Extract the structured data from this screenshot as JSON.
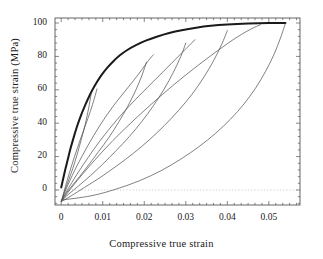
{
  "chart_data": {
    "type": "line",
    "title": "",
    "xlabel": "Compressive true strain",
    "ylabel": "Compressive true strain (MPa)",
    "xlim": [
      -0.0015,
      0.0575
    ],
    "ylim": [
      -9,
      103
    ],
    "xticks": [
      0,
      0.01,
      0.02,
      0.03,
      0.04,
      0.05
    ],
    "xtick_labels": [
      "0",
      "0.01",
      "0.02",
      "0.03",
      "0.04",
      "0.05"
    ],
    "yticks": [
      0,
      20,
      40,
      60,
      80,
      100
    ],
    "ytick_labels": [
      "0",
      "20",
      "40",
      "60",
      "80",
      "100"
    ],
    "x_minor_ticks": 5,
    "y_minor_ticks": 4,
    "grid": false,
    "legend": null,
    "zero_line": {
      "y": 0,
      "style": "dotted",
      "color": "#b9b9b9"
    },
    "frame": {
      "color": "#555555"
    },
    "series": [
      {
        "name": "Loading envelope",
        "role": "monotonic-envelope",
        "color": "#1a1a1a",
        "width": 2.0,
        "points": [
          [
            0.0,
            1.5
          ],
          [
            0.0004,
            6.0
          ],
          [
            0.001,
            12.5
          ],
          [
            0.0016,
            18.5
          ],
          [
            0.0022,
            24.5
          ],
          [
            0.003,
            31.5
          ],
          [
            0.0038,
            38.0
          ],
          [
            0.0048,
            45.0
          ],
          [
            0.0058,
            51.0
          ],
          [
            0.007,
            57.5
          ],
          [
            0.0082,
            63.0
          ],
          [
            0.0096,
            68.5
          ],
          [
            0.011,
            73.0
          ],
          [
            0.0125,
            77.0
          ],
          [
            0.0142,
            80.8
          ],
          [
            0.016,
            84.0
          ],
          [
            0.018,
            86.8
          ],
          [
            0.0205,
            89.6
          ],
          [
            0.023,
            91.8
          ],
          [
            0.026,
            94.0
          ],
          [
            0.029,
            95.7
          ],
          [
            0.0325,
            97.2
          ],
          [
            0.036,
            98.3
          ],
          [
            0.04,
            99.1
          ],
          [
            0.045,
            99.7
          ],
          [
            0.05,
            100.0
          ],
          [
            0.054,
            100.0
          ]
        ]
      },
      {
        "name": "Unload 1",
        "role": "unloading",
        "color": "#4a4a4a",
        "width": 0.7,
        "peak": [
          0.0072,
          57.5
        ],
        "end": [
          0.0002,
          -5.5
        ],
        "points": [
          [
            0.0072,
            57.5
          ],
          [
            0.0066,
            49.0
          ],
          [
            0.0058,
            39.5
          ],
          [
            0.0048,
            30.0
          ],
          [
            0.0038,
            21.0
          ],
          [
            0.0028,
            13.0
          ],
          [
            0.0018,
            6.0
          ],
          [
            0.001,
            0.5
          ],
          [
            0.0005,
            -3.0
          ],
          [
            0.0002,
            -5.5
          ]
        ]
      },
      {
        "name": "Reload 1",
        "role": "reloading",
        "color": "#4a4a4a",
        "width": 0.7,
        "points": [
          [
            0.0002,
            -5.5
          ],
          [
            0.001,
            2.0
          ],
          [
            0.002,
            10.5
          ],
          [
            0.0032,
            20.0
          ],
          [
            0.0045,
            29.5
          ],
          [
            0.0058,
            38.5
          ],
          [
            0.007,
            47.0
          ],
          [
            0.008,
            55.0
          ],
          [
            0.0086,
            60.5
          ]
        ]
      },
      {
        "name": "Unload 2",
        "role": "unloading",
        "color": "#4a4a4a",
        "width": 0.7,
        "peak": [
          0.0205,
          76.5
        ],
        "end": [
          0.0001,
          -6.2
        ],
        "points": [
          [
            0.0205,
            76.5
          ],
          [
            0.0195,
            69.0
          ],
          [
            0.018,
            60.0
          ],
          [
            0.016,
            50.0
          ],
          [
            0.0138,
            40.5
          ],
          [
            0.0115,
            31.5
          ],
          [
            0.009,
            23.0
          ],
          [
            0.0066,
            15.0
          ],
          [
            0.0044,
            8.0
          ],
          [
            0.0026,
            2.5
          ],
          [
            0.0012,
            -2.0
          ],
          [
            0.0001,
            -6.2
          ]
        ]
      },
      {
        "name": "Reload 2",
        "role": "reloading",
        "color": "#4a4a4a",
        "width": 0.7,
        "points": [
          [
            0.0001,
            -6.2
          ],
          [
            0.0016,
            3.0
          ],
          [
            0.0038,
            14.5
          ],
          [
            0.0064,
            26.5
          ],
          [
            0.0094,
            39.0
          ],
          [
            0.0126,
            50.5
          ],
          [
            0.0158,
            60.5
          ],
          [
            0.0188,
            70.0
          ],
          [
            0.021,
            77.5
          ],
          [
            0.0222,
            81.0
          ]
        ]
      },
      {
        "name": "Unload 3",
        "role": "unloading",
        "color": "#4a4a4a",
        "width": 0.7,
        "peak": [
          0.03,
          88.0
        ],
        "end": [
          0.0,
          -6.6
        ],
        "points": [
          [
            0.03,
            88.0
          ],
          [
            0.0288,
            80.0
          ],
          [
            0.027,
            70.5
          ],
          [
            0.0248,
            60.5
          ],
          [
            0.0222,
            50.5
          ],
          [
            0.0194,
            41.0
          ],
          [
            0.0164,
            32.0
          ],
          [
            0.0132,
            23.5
          ],
          [
            0.01,
            15.5
          ],
          [
            0.007,
            8.5
          ],
          [
            0.0042,
            2.5
          ],
          [
            0.0018,
            -2.5
          ],
          [
            0.0,
            -6.6
          ]
        ]
      },
      {
        "name": "Reload 3",
        "role": "reloading",
        "color": "#4a4a4a",
        "width": 0.7,
        "points": [
          [
            0.0,
            -6.6
          ],
          [
            0.0022,
            3.0
          ],
          [
            0.0054,
            15.5
          ],
          [
            0.0092,
            29.0
          ],
          [
            0.0134,
            42.0
          ],
          [
            0.0178,
            54.0
          ],
          [
            0.0222,
            65.0
          ],
          [
            0.0264,
            75.5
          ],
          [
            0.03,
            84.5
          ],
          [
            0.0322,
            90.0
          ]
        ]
      },
      {
        "name": "Unload 4",
        "role": "unloading",
        "color": "#4a4a4a",
        "width": 0.7,
        "peak": [
          0.04,
          95.5
        ],
        "end": [
          0.0,
          -7.0
        ],
        "points": [
          [
            0.04,
            95.5
          ],
          [
            0.0386,
            87.0
          ],
          [
            0.0366,
            77.0
          ],
          [
            0.0342,
            67.0
          ],
          [
            0.0314,
            57.0
          ],
          [
            0.0282,
            47.5
          ],
          [
            0.0248,
            38.5
          ],
          [
            0.0212,
            30.0
          ],
          [
            0.0174,
            22.0
          ],
          [
            0.0134,
            14.5
          ],
          [
            0.0094,
            7.5
          ],
          [
            0.0056,
            1.5
          ],
          [
            0.0024,
            -3.5
          ],
          [
            0.0,
            -7.0
          ]
        ]
      },
      {
        "name": "Reload 4",
        "role": "reloading",
        "color": "#4a4a4a",
        "width": 0.7,
        "points": [
          [
            0.0,
            -7.0
          ],
          [
            0.003,
            3.0
          ],
          [
            0.0074,
            16.0
          ],
          [
            0.0124,
            29.5
          ],
          [
            0.018,
            43.0
          ],
          [
            0.0238,
            56.0
          ],
          [
            0.0298,
            68.5
          ],
          [
            0.0358,
            80.0
          ],
          [
            0.0414,
            90.0
          ],
          [
            0.0454,
            96.0
          ],
          [
            0.048,
            99.0
          ]
        ]
      },
      {
        "name": "Final unload",
        "role": "unloading",
        "color": "#4a4a4a",
        "width": 0.7,
        "peak": [
          0.054,
          100.0
        ],
        "end": [
          0.0002,
          -6.0
        ],
        "points": [
          [
            0.054,
            100.0
          ],
          [
            0.0528,
            91.0
          ],
          [
            0.0512,
            81.0
          ],
          [
            0.0492,
            71.0
          ],
          [
            0.0468,
            61.0
          ],
          [
            0.044,
            51.5
          ],
          [
            0.0408,
            42.5
          ],
          [
            0.0372,
            34.0
          ],
          [
            0.0332,
            26.0
          ],
          [
            0.0288,
            18.5
          ],
          [
            0.024,
            11.5
          ],
          [
            0.0188,
            5.5
          ],
          [
            0.0132,
            0.5
          ],
          [
            0.0072,
            -3.5
          ],
          [
            0.0002,
            -6.0
          ]
        ]
      }
    ]
  }
}
